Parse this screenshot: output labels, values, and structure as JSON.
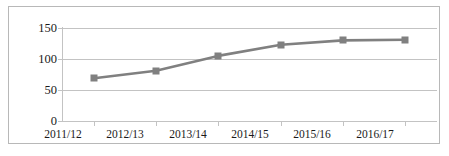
{
  "chart_data": {
    "type": "line",
    "title": "",
    "subtitle": "",
    "xlabel": "",
    "ylabel": "",
    "categories": [
      "2011/12",
      "2012/13",
      "2013/14",
      "2014/15",
      "2015/16",
      "2016/17"
    ],
    "series": [
      {
        "name": "Series 1",
        "values": [
          69,
          81,
          105,
          123,
          130,
          131
        ],
        "color": "#808080",
        "marker": "square"
      }
    ],
    "ylim": [
      0,
      150
    ],
    "yticks": [
      0,
      50,
      100,
      150
    ],
    "ytick_labels": [
      "0",
      "50",
      "100",
      "150"
    ],
    "grid": true,
    "grid_axis": "y",
    "legend": false,
    "legend_position": "none",
    "border": true
  },
  "style": {
    "line_color": "#808080",
    "marker_color": "#808080",
    "grid_color": "#c3c3c3",
    "axis_color": "#c3c3c3",
    "frame_color": "#b8b8b8",
    "text_color": "#1a1a1a",
    "background": "#ffffff"
  }
}
